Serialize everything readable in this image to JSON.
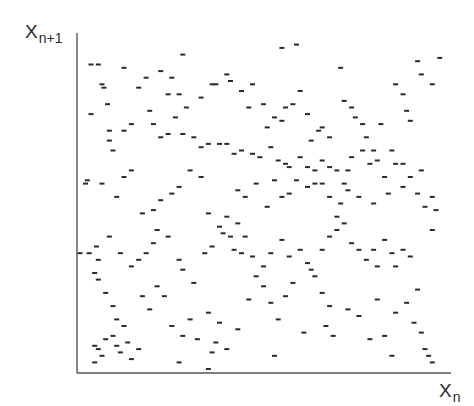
{
  "chart_data": {
    "type": "scatter",
    "title": "",
    "xlabel": "X_n",
    "ylabel": "X_{n+1}",
    "xlabel_parts": {
      "main": "X",
      "sub": "n"
    },
    "ylabel_parts": {
      "main": "X",
      "sub": "n+1"
    },
    "xlim": [
      0,
      1
    ],
    "ylim": [
      0,
      1
    ],
    "grid": false,
    "legend": null,
    "tick_labels": false,
    "marker": "short dash",
    "marker_color": "#2a2a2a",
    "axis_color": "#555555",
    "points": [
      [
        0.03,
        0.92
      ],
      [
        0.05,
        0.92
      ],
      [
        0.06,
        0.86
      ],
      [
        0.065,
        0.85
      ],
      [
        0.075,
        0.8
      ],
      [
        0.03,
        0.77
      ],
      [
        0.12,
        0.91
      ],
      [
        0.18,
        0.88
      ],
      [
        0.16,
        0.85
      ],
      [
        0.22,
        0.9
      ],
      [
        0.25,
        0.88
      ],
      [
        0.24,
        0.83
      ],
      [
        0.27,
        0.83
      ],
      [
        0.26,
        0.76
      ],
      [
        0.29,
        0.79
      ],
      [
        0.33,
        0.82
      ],
      [
        0.31,
        0.7
      ],
      [
        0.36,
        0.86
      ],
      [
        0.37,
        0.86
      ],
      [
        0.4,
        0.89
      ],
      [
        0.41,
        0.87
      ],
      [
        0.44,
        0.84
      ],
      [
        0.46,
        0.79
      ],
      [
        0.47,
        0.86
      ],
      [
        0.5,
        0.8
      ],
      [
        0.51,
        0.73
      ],
      [
        0.53,
        0.76
      ],
      [
        0.55,
        0.75
      ],
      [
        0.56,
        0.79
      ],
      [
        0.58,
        0.8
      ],
      [
        0.6,
        0.84
      ],
      [
        0.62,
        0.77
      ],
      [
        0.63,
        0.69
      ],
      [
        0.65,
        0.72
      ],
      [
        0.66,
        0.73
      ],
      [
        0.68,
        0.7
      ],
      [
        0.71,
        0.91
      ],
      [
        0.72,
        0.81
      ],
      [
        0.74,
        0.79
      ],
      [
        0.75,
        0.76
      ],
      [
        0.77,
        0.74
      ],
      [
        0.78,
        0.7
      ],
      [
        0.8,
        0.66
      ],
      [
        0.82,
        0.74
      ],
      [
        0.86,
        0.86
      ],
      [
        0.88,
        0.83
      ],
      [
        0.89,
        0.78
      ],
      [
        0.9,
        0.75
      ],
      [
        0.93,
        0.89
      ],
      [
        0.96,
        0.86
      ],
      [
        0.98,
        0.94
      ],
      [
        0.92,
        0.93
      ],
      [
        0.55,
        0.97
      ],
      [
        0.59,
        0.98
      ],
      [
        0.28,
        0.95
      ],
      [
        0.19,
        0.78
      ],
      [
        0.2,
        0.74
      ],
      [
        0.14,
        0.74
      ],
      [
        0.12,
        0.72
      ],
      [
        0.08,
        0.72
      ],
      [
        0.09,
        0.66
      ],
      [
        0.22,
        0.7
      ],
      [
        0.24,
        0.71
      ],
      [
        0.28,
        0.71
      ],
      [
        0.33,
        0.67
      ],
      [
        0.35,
        0.68
      ],
      [
        0.38,
        0.68
      ],
      [
        0.4,
        0.68
      ],
      [
        0.42,
        0.65
      ],
      [
        0.44,
        0.66
      ],
      [
        0.47,
        0.65
      ],
      [
        0.49,
        0.64
      ],
      [
        0.52,
        0.67
      ],
      [
        0.54,
        0.63
      ],
      [
        0.56,
        0.62
      ],
      [
        0.57,
        0.61
      ],
      [
        0.6,
        0.64
      ],
      [
        0.62,
        0.61
      ],
      [
        0.64,
        0.6
      ],
      [
        0.66,
        0.63
      ],
      [
        0.68,
        0.61
      ],
      [
        0.7,
        0.6
      ],
      [
        0.72,
        0.56
      ],
      [
        0.73,
        0.6
      ],
      [
        0.74,
        0.64
      ],
      [
        0.77,
        0.66
      ],
      [
        0.79,
        0.62
      ],
      [
        0.81,
        0.63
      ],
      [
        0.83,
        0.58
      ],
      [
        0.85,
        0.66
      ],
      [
        0.86,
        0.62
      ],
      [
        0.88,
        0.62
      ],
      [
        0.9,
        0.58
      ],
      [
        0.93,
        0.6
      ],
      [
        0.96,
        0.52
      ],
      [
        0.97,
        0.48
      ],
      [
        0.94,
        0.49
      ],
      [
        0.92,
        0.53
      ],
      [
        0.88,
        0.55
      ],
      [
        0.84,
        0.53
      ],
      [
        0.8,
        0.5
      ],
      [
        0.76,
        0.52
      ],
      [
        0.73,
        0.54
      ],
      [
        0.71,
        0.5
      ],
      [
        0.7,
        0.46
      ],
      [
        0.68,
        0.52
      ],
      [
        0.66,
        0.56
      ],
      [
        0.64,
        0.56
      ],
      [
        0.62,
        0.55
      ],
      [
        0.59,
        0.57
      ],
      [
        0.57,
        0.53
      ],
      [
        0.55,
        0.52
      ],
      [
        0.53,
        0.57
      ],
      [
        0.51,
        0.49
      ],
      [
        0.48,
        0.56
      ],
      [
        0.45,
        0.52
      ],
      [
        0.43,
        0.54
      ],
      [
        0.4,
        0.46
      ],
      [
        0.38,
        0.43
      ],
      [
        0.35,
        0.47
      ],
      [
        0.33,
        0.58
      ],
      [
        0.3,
        0.6
      ],
      [
        0.27,
        0.55
      ],
      [
        0.25,
        0.53
      ],
      [
        0.22,
        0.51
      ],
      [
        0.2,
        0.48
      ],
      [
        0.17,
        0.47
      ],
      [
        0.14,
        0.6
      ],
      [
        0.12,
        0.58
      ],
      [
        0.1,
        0.52
      ],
      [
        0.06,
        0.56
      ],
      [
        0.015,
        0.56
      ],
      [
        0.02,
        0.57
      ],
      [
        0.08,
        0.69
      ],
      [
        0.025,
        0.35
      ],
      [
        0.05,
        0.33
      ],
      [
        0.045,
        0.37
      ],
      [
        0.08,
        0.4
      ],
      [
        0.11,
        0.35
      ],
      [
        0.14,
        0.31
      ],
      [
        0.16,
        0.33
      ],
      [
        0.18,
        0.35
      ],
      [
        0.2,
        0.38
      ],
      [
        0.21,
        0.42
      ],
      [
        0.24,
        0.4
      ],
      [
        0.27,
        0.33
      ],
      [
        0.28,
        0.3
      ],
      [
        0.31,
        0.26
      ],
      [
        0.34,
        0.35
      ],
      [
        0.36,
        0.37
      ],
      [
        0.39,
        0.41
      ],
      [
        0.41,
        0.4
      ],
      [
        0.43,
        0.44
      ],
      [
        0.45,
        0.4
      ],
      [
        0.42,
        0.36
      ],
      [
        0.44,
        0.35
      ],
      [
        0.47,
        0.34
      ],
      [
        0.5,
        0.31
      ],
      [
        0.52,
        0.35
      ],
      [
        0.55,
        0.39
      ],
      [
        0.57,
        0.34
      ],
      [
        0.6,
        0.36
      ],
      [
        0.62,
        0.32
      ],
      [
        0.63,
        0.3
      ],
      [
        0.66,
        0.36
      ],
      [
        0.68,
        0.4
      ],
      [
        0.7,
        0.42
      ],
      [
        0.72,
        0.44
      ],
      [
        0.74,
        0.38
      ],
      [
        0.76,
        0.36
      ],
      [
        0.78,
        0.33
      ],
      [
        0.8,
        0.36
      ],
      [
        0.81,
        0.31
      ],
      [
        0.83,
        0.39
      ],
      [
        0.85,
        0.35
      ],
      [
        0.86,
        0.31
      ],
      [
        0.88,
        0.36
      ],
      [
        0.9,
        0.34
      ],
      [
        0.92,
        0.24
      ],
      [
        0.96,
        0.42
      ],
      [
        0.0,
        0.35
      ],
      [
        0.04,
        0.29
      ],
      [
        0.05,
        0.27
      ],
      [
        0.07,
        0.23
      ],
      [
        0.09,
        0.19
      ],
      [
        0.1,
        0.15
      ],
      [
        0.12,
        0.13
      ],
      [
        0.09,
        0.1
      ],
      [
        0.07,
        0.09
      ],
      [
        0.05,
        0.06
      ],
      [
        0.04,
        0.07
      ],
      [
        0.06,
        0.04
      ],
      [
        0.04,
        0.02
      ],
      [
        0.1,
        0.07
      ],
      [
        0.11,
        0.05
      ],
      [
        0.13,
        0.08
      ],
      [
        0.14,
        0.03
      ],
      [
        0.16,
        0.06
      ],
      [
        0.19,
        0.18
      ],
      [
        0.17,
        0.22
      ],
      [
        0.21,
        0.25
      ],
      [
        0.23,
        0.22
      ],
      [
        0.25,
        0.13
      ],
      [
        0.28,
        0.1
      ],
      [
        0.3,
        0.15
      ],
      [
        0.32,
        0.09
      ],
      [
        0.35,
        0.17
      ],
      [
        0.36,
        0.05
      ],
      [
        0.37,
        0.08
      ],
      [
        0.35,
        0.0
      ],
      [
        0.38,
        0.14
      ],
      [
        0.4,
        0.06
      ],
      [
        0.43,
        0.12
      ],
      [
        0.46,
        0.21
      ],
      [
        0.48,
        0.28
      ],
      [
        0.5,
        0.25
      ],
      [
        0.52,
        0.2
      ],
      [
        0.54,
        0.15
      ],
      [
        0.56,
        0.22
      ],
      [
        0.58,
        0.26
      ],
      [
        0.53,
        0.04
      ],
      [
        0.61,
        0.11
      ],
      [
        0.64,
        0.28
      ],
      [
        0.66,
        0.23
      ],
      [
        0.68,
        0.19
      ],
      [
        0.67,
        0.13
      ],
      [
        0.69,
        0.1
      ],
      [
        0.73,
        0.18
      ],
      [
        0.76,
        0.16
      ],
      [
        0.79,
        0.09
      ],
      [
        0.81,
        0.21
      ],
      [
        0.83,
        0.1
      ],
      [
        0.86,
        0.17
      ],
      [
        0.89,
        0.2
      ],
      [
        0.91,
        0.14
      ],
      [
        0.93,
        0.11
      ],
      [
        0.94,
        0.06
      ],
      [
        0.95,
        0.04
      ],
      [
        0.96,
        0.02
      ],
      [
        0.85,
        0.04
      ],
      [
        0.27,
        0.02
      ]
    ]
  },
  "labels": {
    "y_main": "X",
    "y_sub": "n+1",
    "x_main": "X",
    "x_sub": "n"
  }
}
